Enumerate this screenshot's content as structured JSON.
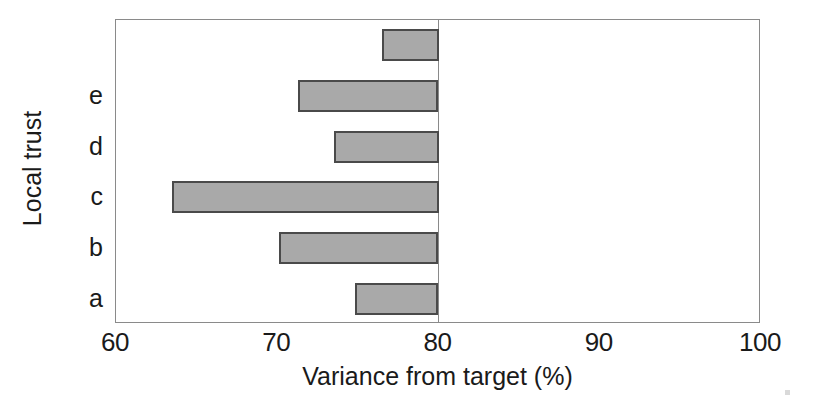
{
  "chart_data": {
    "type": "bar",
    "orientation": "horizontal",
    "title": "",
    "xlabel": "Variance from target (%)",
    "ylabel": "Local trust",
    "xlim": [
      60,
      100
    ],
    "ylim": [
      0,
      6
    ],
    "xticks": [
      60,
      70,
      80,
      100
    ],
    "xticklabels": [
      "60",
      "70",
      "80",
      "90",
      "100"
    ],
    "xtick_values": [
      60,
      70,
      80,
      90,
      100
    ],
    "grid": false,
    "legend": null,
    "baseline": 80,
    "baseline_note": "bars are drawn from the 80% target line leftwards",
    "categories": [
      "a",
      "b",
      "c",
      "d",
      "e",
      ""
    ],
    "values": [
      74.8,
      70.1,
      63.5,
      73.5,
      71.3,
      76.5
    ],
    "bars": [
      {
        "label": "",
        "value": 76.5,
        "from": 80
      },
      {
        "label": "e",
        "value": 71.3,
        "from": 80
      },
      {
        "label": "d",
        "value": 73.5,
        "from": 80
      },
      {
        "label": "c",
        "value": 63.5,
        "from": 80
      },
      {
        "label": "b",
        "value": 70.1,
        "from": 80
      },
      {
        "label": "a",
        "value": 74.8,
        "from": 80
      }
    ],
    "colors": {
      "bar_fill": "#a9a9a9",
      "bar_edge": "#4a4a4a",
      "axis": "#8a8a8a",
      "text": "#1a1a1a",
      "background": "#ffffff"
    }
  }
}
